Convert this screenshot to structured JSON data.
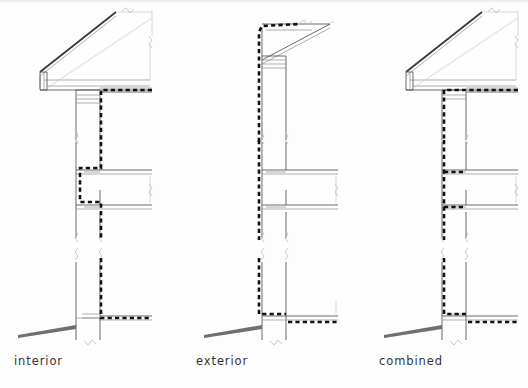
{
  "drawing": {
    "title": "air barrier continuity wall section details",
    "background_color": "#fdfdfd",
    "line_color": "#555555",
    "barrier_color": "#111111",
    "hatch_color": "#999999",
    "caption_color": "#333333"
  },
  "captions": {
    "interior": "interior",
    "exterior": "exterior",
    "combined": "combined"
  },
  "columns": [
    {
      "id": "interior",
      "label": "interior",
      "barrier_strategy": "air barrier located on the interior face of the wall and at the ceiling plane",
      "details": [
        {
          "name": "roof-eave-detail",
          "barrier_path": "ceiling plane turning down interior face of wall"
        },
        {
          "name": "floor-band-detail",
          "barrier_path": "stepped around floor assembly on interior side"
        },
        {
          "name": "foundation-slab-detail",
          "barrier_path": "interior face of wall turning out over slab"
        }
      ]
    },
    {
      "id": "exterior",
      "label": "exterior",
      "barrier_strategy": "air barrier located continuously on the exterior face of the wall and roof",
      "details": [
        {
          "name": "roof-eave-detail",
          "barrier_path": "exterior wall face continuing over roof edge"
        },
        {
          "name": "floor-band-detail",
          "barrier_path": "straight and uninterrupted at exterior face"
        },
        {
          "name": "foundation-slab-detail",
          "barrier_path": "exterior face turning in at slab edge"
        }
      ]
    },
    {
      "id": "combined",
      "label": "combined",
      "barrier_strategy": "air barrier combining exterior wall plane with interior ceiling and floor planes",
      "details": [
        {
          "name": "roof-eave-detail",
          "barrier_path": "ceiling plane turning down wall face"
        },
        {
          "name": "floor-band-detail",
          "barrier_path": "exterior face with branches at each floor level"
        },
        {
          "name": "foundation-slab-detail",
          "barrier_path": "wall face turning out at slab level"
        }
      ]
    }
  ],
  "legend_notes": {
    "heavy_dashed": "air barrier / continuity line",
    "thin_solid": "building assembly lines",
    "squiggle": "break line",
    "grade_wedge": "finish grade"
  }
}
